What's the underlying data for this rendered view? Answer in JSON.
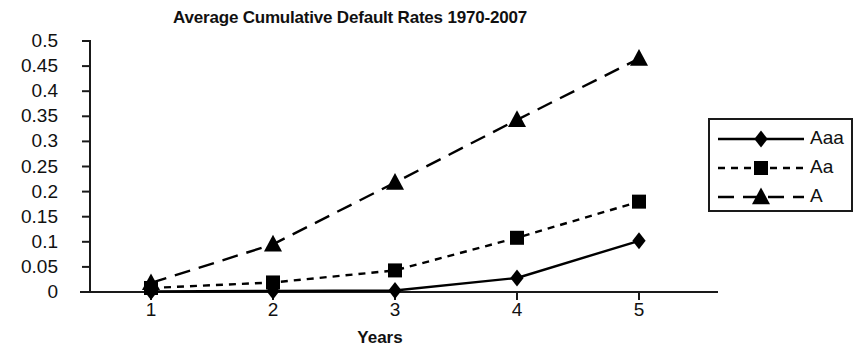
{
  "chart_data": {
    "type": "line",
    "title": "Average Cumulative Default Rates 1970-2007",
    "xlabel": "Years",
    "ylabel": "",
    "x": [
      1,
      2,
      3,
      4,
      5
    ],
    "categories": [
      "1",
      "2",
      "3",
      "4",
      "5"
    ],
    "xtick_labels": [
      "1",
      "2",
      "3",
      "4",
      "5"
    ],
    "ytick_labels": [
      "0.5",
      "0.45",
      "0.4",
      "0.35",
      "0.3",
      "0.25",
      "0.2",
      "0.15",
      "0.1",
      "0.05",
      "0"
    ],
    "ytick_values": [
      0.5,
      0.45,
      0.4,
      0.35,
      0.3,
      0.25,
      0.2,
      0.15,
      0.1,
      0.05,
      0
    ],
    "ylim": [
      0,
      0.5
    ],
    "xlim": [
      0.5,
      5.5
    ],
    "grid": false,
    "legend_position": "right",
    "series": [
      {
        "name": "Aaa",
        "marker": "diamond",
        "line_style": "solid",
        "color": "#000000",
        "values": [
          0.001,
          0.002,
          0.003,
          0.028,
          0.102
        ]
      },
      {
        "name": "Aa",
        "marker": "square",
        "line_style": "dotted",
        "color": "#000000",
        "values": [
          0.008,
          0.019,
          0.043,
          0.108,
          0.18
        ]
      },
      {
        "name": "A",
        "marker": "triangle",
        "line_style": "dashed",
        "color": "#000000",
        "values": [
          0.018,
          0.095,
          0.218,
          0.343,
          0.465
        ]
      }
    ]
  },
  "legend": {
    "entries": [
      {
        "label": "Aaa"
      },
      {
        "label": "Aa"
      },
      {
        "label": "A"
      }
    ]
  },
  "colors": {
    "ink": "#000000",
    "axis": "#1a1a1a",
    "background": "#ffffff"
  }
}
